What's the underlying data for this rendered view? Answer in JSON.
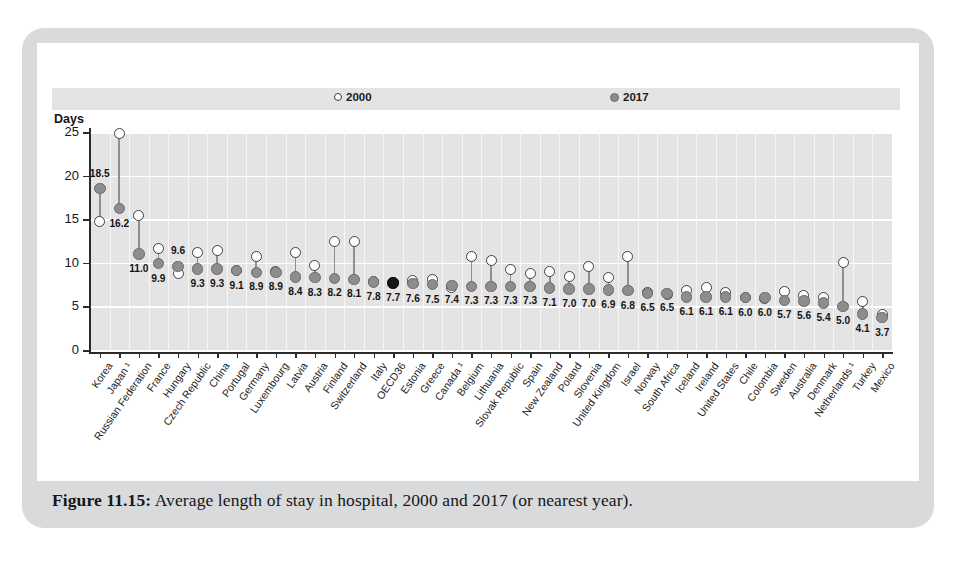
{
  "figure": {
    "caption_label": "Figure 11.15:",
    "caption_text": " Average length of stay in hospital, 2000 and 2017 (or nearest year)."
  },
  "chart_data": {
    "type": "scatter",
    "title": "",
    "xlabel": "",
    "ylabel": "Days",
    "ylim": [
      0,
      25
    ],
    "yticks": [
      0,
      5,
      10,
      15,
      20,
      25
    ],
    "grid": true,
    "legend_position": "top",
    "highlight_category": "OECD36",
    "highlight_color": "#161616",
    "series_colors": {
      "2000": "#ffffff",
      "2017": "#8d8d8d"
    },
    "legend": [
      {
        "marker": "open-circle",
        "name": "2000"
      },
      {
        "marker": "filled-circle",
        "name": "2017"
      }
    ],
    "categories": [
      "Korea",
      "Japan ¹",
      "Russian Federation",
      "France",
      "Hungary",
      "Czech Republic",
      "China",
      "Portugal",
      "Germany",
      "Luxembourg",
      "Latvia",
      "Austria",
      "Finland",
      "Switzerland",
      "Italy",
      "OECD36",
      "Estonia",
      "Greece",
      "Canada ¹",
      "Belgium",
      "Lithuania",
      "Slovak Republic",
      "Spain",
      "New Zealand",
      "Poland",
      "Slovenia",
      "United Kingdom",
      "Israel",
      "Norway",
      "South Africa",
      "Iceland",
      "Ireland",
      "United States",
      "Chile",
      "Colombia",
      "Sweden",
      "Australia",
      "Denmark",
      "Netherlands ¹",
      "Turkey",
      "Mexico"
    ],
    "series": [
      {
        "name": "2017",
        "values": [
          18.5,
          16.2,
          11.0,
          9.9,
          9.6,
          9.3,
          9.3,
          9.1,
          8.9,
          8.9,
          8.4,
          8.3,
          8.2,
          8.1,
          7.8,
          7.7,
          7.6,
          7.5,
          7.4,
          7.3,
          7.3,
          7.3,
          7.3,
          7.1,
          7.0,
          7.0,
          6.9,
          6.8,
          6.5,
          6.5,
          6.1,
          6.1,
          6.1,
          6.0,
          6.0,
          5.7,
          5.6,
          5.4,
          5.0,
          4.1,
          3.7
        ],
        "labels": [
          "18.5",
          "16.2",
          "11.0",
          "9.9",
          "9.6",
          "9.3",
          "9.3",
          "9.1",
          "8.9",
          "8.9",
          "8.4",
          "8.3",
          "8.2",
          "8.1",
          "7.8",
          "7.7",
          "7.6",
          "7.5",
          "7.4",
          "7.3",
          "7.3",
          "7.3",
          "7.3",
          "7.1",
          "7.0",
          "7.0",
          "6.9",
          "6.8",
          "6.5",
          "6.5",
          "6.1",
          "6.1",
          "6.1",
          "6.0",
          "6.0",
          "5.7",
          "5.6",
          "5.4",
          "5.0",
          "4.1",
          "3.7"
        ]
      },
      {
        "name": "2000",
        "values": [
          14.7,
          24.8,
          15.4,
          11.6,
          8.8,
          11.2,
          11.4,
          9.1,
          10.7,
          9.0,
          11.2,
          9.7,
          12.4,
          12.5,
          7.9,
          7.7,
          8.0,
          8.1,
          7.2,
          10.7,
          10.3,
          9.2,
          8.8,
          9.0,
          8.4,
          9.6,
          8.3,
          10.7,
          6.6,
          6.4,
          6.8,
          7.2,
          6.6,
          6.0,
          5.9,
          6.7,
          6.2,
          6.0,
          10.0,
          5.6,
          4.1
        ]
      }
    ]
  }
}
